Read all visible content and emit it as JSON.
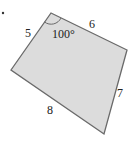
{
  "figure": {
    "type": "quadrilateral",
    "fill_color": "#dcdcdc",
    "stroke_color": "#6a6a6a",
    "vertices": {
      "top": [
        51,
        13
      ],
      "right": [
        127,
        50
      ],
      "bottom": [
        104,
        134
      ],
      "left": [
        11,
        70
      ]
    },
    "sides": {
      "top_left": "5",
      "top_right": "6",
      "right": "7",
      "bottom": "8"
    },
    "angle": {
      "vertex": "top",
      "label": "100°"
    },
    "marker_dot": true
  }
}
